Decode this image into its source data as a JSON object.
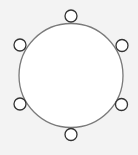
{
  "diagram": {
    "background": "#f3f3f3",
    "table": {
      "cx": 71,
      "cy": 75.5,
      "r": 52,
      "fill": "#ffffff",
      "stroke": "#7a7a7a",
      "stroke_width": 1.3
    },
    "seats": [
      {
        "name": "seat-top",
        "cx": 71,
        "cy": 16,
        "r": 6
      },
      {
        "name": "seat-upper-right",
        "cx": 122,
        "cy": 45.5,
        "r": 6
      },
      {
        "name": "seat-lower-right",
        "cx": 121.5,
        "cy": 104.5,
        "r": 6
      },
      {
        "name": "seat-bottom",
        "cx": 71,
        "cy": 134.5,
        "r": 6
      },
      {
        "name": "seat-lower-left",
        "cx": 20,
        "cy": 104,
        "r": 6
      },
      {
        "name": "seat-upper-left",
        "cx": 20,
        "cy": 45,
        "r": 6
      }
    ],
    "seat_style": {
      "fill": "#ffffff",
      "stroke": "#333333",
      "stroke_width": 1.3
    }
  }
}
